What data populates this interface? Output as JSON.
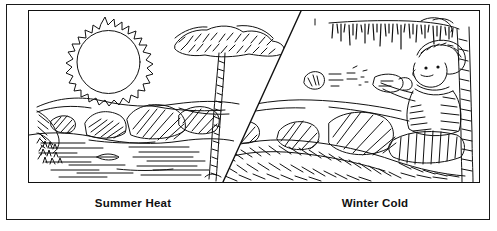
{
  "figure": {
    "line_color": "#111111",
    "background_color": "#ffffff",
    "frame_color": "#1a1a1a"
  },
  "captions": {
    "left_label": "Summer Heat",
    "right_label": "Winter Cold"
  },
  "panels": [
    {
      "id": "summer",
      "label": "Summer Heat",
      "elements": [
        {
          "name": "sun",
          "description": "large jagged-rayed sun disc in the sky"
        },
        {
          "name": "tree",
          "description": "leafy broad-canopy tree with tall trunk"
        },
        {
          "name": "hill-horizon",
          "description": "rolling hillside horizon line"
        },
        {
          "name": "boulders",
          "description": "cross-hatched rocks along the shore"
        },
        {
          "name": "pond-water",
          "description": "pond with horizontal ripple lines"
        },
        {
          "name": "grass-tufts",
          "description": "small clumps of grass on the bank"
        }
      ]
    },
    {
      "id": "winter",
      "label": "Winter Cold",
      "elements": [
        {
          "name": "icicle-branch",
          "description": "bare branch hung with icicles"
        },
        {
          "name": "child-figure",
          "description": "bundled child in cap and coat, arm extended"
        },
        {
          "name": "mitten-hand",
          "description": "mittened throwing hand"
        },
        {
          "name": "snowball",
          "description": "snowball in flight with motion streaks"
        },
        {
          "name": "snow-bank",
          "description": "snow-covered drifts with hatched shading"
        },
        {
          "name": "snow-covered-rocks",
          "description": "rocks capped with snow"
        },
        {
          "name": "tree-trunk-right",
          "description": "vertical tree trunk at right edge"
        }
      ]
    }
  ],
  "divider": {
    "name": "diagonal-divider",
    "description": "diagonal line separating the summer and winter halves",
    "from": {
      "x": 272,
      "y": 0
    },
    "to": {
      "x": 194,
      "y": 173
    }
  }
}
